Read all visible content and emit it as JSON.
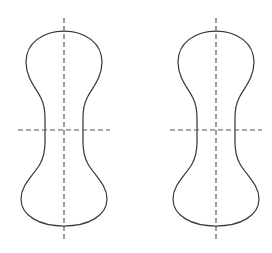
{
  "figure": {
    "title": "Two body-of-revolution profile outlines with centerlines",
    "background_color": "#ffffff",
    "outline_color": "#3b3b3f",
    "centerline_color": "#55555a",
    "outline_stroke_width": 1.25,
    "centerline_stroke_width": 1.15,
    "centerline_dash_pattern": "5 3",
    "shape_count": 2,
    "shape_label": "gourd-profile",
    "shapes": [
      {
        "id": "left",
        "name": "left-gourd-shape",
        "center_x": 64,
        "top_y": 31,
        "bottom_y": 226,
        "waist_y": 130,
        "upper_lobe_half_width": 38,
        "lower_lobe_half_width": 43,
        "waist_half_width": 19,
        "vertical_centerline": {
          "x": 64,
          "y1": 18,
          "y2": 240
        },
        "horizontal_centerline": {
          "y": 130,
          "x1": 18,
          "x2": 110
        }
      },
      {
        "id": "right",
        "name": "right-gourd-shape",
        "center_x": 216,
        "top_y": 31,
        "bottom_y": 226,
        "waist_y": 130,
        "upper_lobe_half_width": 38,
        "lower_lobe_half_width": 43,
        "waist_half_width": 19,
        "vertical_centerline": {
          "x": 216,
          "y1": 18,
          "y2": 240
        },
        "horizontal_centerline": {
          "y": 130,
          "x1": 170,
          "x2": 262
        }
      }
    ]
  }
}
